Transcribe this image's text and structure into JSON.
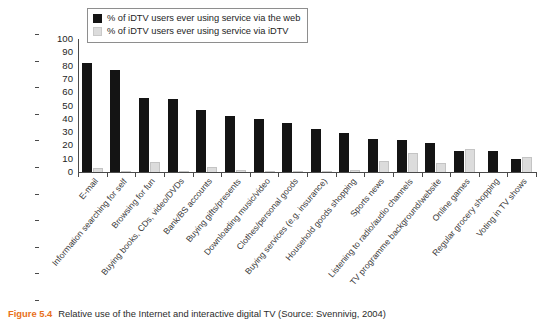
{
  "figure": {
    "caption_number": "Figure 5.4",
    "caption_text": "Relative use of the Internet and interactive digital TV (Source: Svennivig, 2004)",
    "caption_accent_color": "#e8701a"
  },
  "legend": {
    "position": "top-left-inside",
    "entries": [
      {
        "label": "% of iDTV users ever using service via the web",
        "color": "#141414",
        "swatch_name": "legend-swatch-web"
      },
      {
        "label": "% of iDTV users ever using service via iDTV",
        "color": "#dcdcdc",
        "swatch_name": "legend-swatch-idtv"
      }
    ]
  },
  "chart_data": {
    "type": "bar",
    "title": "",
    "xlabel": "",
    "ylabel": "",
    "ylim": [
      0,
      100
    ],
    "yticks": [
      0,
      10,
      20,
      30,
      40,
      50,
      60,
      70,
      80,
      90,
      100
    ],
    "grid": false,
    "legend_position": "upper left",
    "categories": [
      "E-mail",
      "Information searching for self",
      "Browsing for fun",
      "Buying books, CDs, video/DVDs",
      "Bank/BS accounts",
      "Buying gifts/presents",
      "Downloading music/video",
      "Clothes/personal goods",
      "Buying services (e.g. insurance)",
      "Household goods shopping",
      "Sports news",
      "Listening to radio/audio channels",
      "TV programme background/website",
      "Online games",
      "Regular grocery shopping",
      "Voting in TV shows"
    ],
    "series": [
      {
        "name": "% of iDTV users ever using service via the web",
        "color": "#141414",
        "values": [
          82,
          77,
          56,
          55,
          47,
          42,
          40,
          37,
          32,
          29,
          25,
          24,
          21.5,
          15.5,
          15.5,
          9.5
        ]
      },
      {
        "name": "% of iDTV users ever using service via iDTV",
        "color": "#dcdcdc",
        "values": [
          3,
          1,
          7.5,
          0.5,
          3.5,
          1.5,
          0.5,
          0.5,
          0.5,
          1.5,
          8,
          14,
          7,
          17,
          0,
          11
        ]
      }
    ]
  }
}
